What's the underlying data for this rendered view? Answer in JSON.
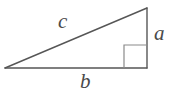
{
  "figure": {
    "kind": "right-triangle-diagram",
    "background_color": "#ffffff",
    "stroke_color": "#565656",
    "label_color": "#4a4a4a",
    "stroke_width": 1.4
  },
  "labels": {
    "hypotenuse": "c",
    "vertical_leg": "a",
    "horizontal_leg": "b"
  },
  "geometry": {
    "vertices": {
      "left": [
        5,
        68
      ],
      "top_right": [
        147,
        8
      ],
      "bottom_right": [
        147,
        68
      ]
    },
    "right_angle_marker": {
      "corner": [
        147,
        68
      ],
      "size": 23
    }
  }
}
